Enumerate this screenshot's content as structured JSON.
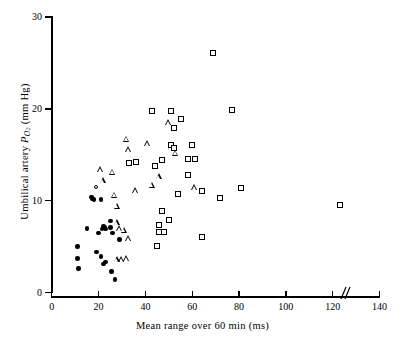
{
  "chart_data": {
    "type": "scatter",
    "title": "",
    "xlabel": "Mean range over 60 min (ms)",
    "ylabel": "Umbilical artery PO2 (mm Hg)",
    "ylabel_parts": {
      "prefix": "Umbilical artery ",
      "symbol": "P",
      "subscript": "O2",
      "suffix": " (mm Hg)"
    },
    "xlim": [
      0,
      140
    ],
    "ylim": [
      0,
      30
    ],
    "xticks": [
      0,
      20,
      40,
      60,
      80,
      100,
      120,
      140
    ],
    "yticks": [
      0,
      10,
      20,
      30
    ],
    "grid": false,
    "legend_position": "none",
    "axis_break": {
      "axis": "x",
      "label": "//",
      "between": [
        100,
        120
      ],
      "position": 106
    },
    "series": [
      {
        "name": "filled-circle",
        "marker": "filled-circle",
        "color": "#000000",
        "points": [
          [
            11,
            5.0
          ],
          [
            11,
            3.7
          ],
          [
            11.5,
            2.6
          ],
          [
            15,
            7.0
          ],
          [
            17,
            10.4
          ],
          [
            17.5,
            10.2
          ],
          [
            18,
            10.1
          ],
          [
            19,
            4.4
          ],
          [
            20,
            6.5
          ],
          [
            21,
            10.1
          ],
          [
            21,
            3.9
          ],
          [
            21.5,
            6.9
          ],
          [
            22,
            7.2
          ],
          [
            22.5,
            7.1
          ],
          [
            23,
            6.9
          ],
          [
            22,
            3.1
          ],
          [
            23,
            3.3
          ],
          [
            25,
            7.8
          ],
          [
            25,
            7.1
          ],
          [
            25.5,
            2.3
          ],
          [
            26,
            6.5
          ],
          [
            27,
            1.4
          ],
          [
            29,
            5.8
          ]
        ]
      },
      {
        "name": "open-circle",
        "marker": "open-circle",
        "color": "#000000",
        "points": [
          [
            19,
            11.5
          ]
        ]
      },
      {
        "name": "open-triangle",
        "marker": "open-triangle",
        "color": "#000000",
        "points": [
          [
            21,
            13.4
          ],
          [
            22,
            12.2
          ],
          [
            26,
            13.1
          ],
          [
            27,
            10.6
          ],
          [
            28,
            9.4
          ],
          [
            28,
            7.6
          ],
          [
            29,
            7.0
          ],
          [
            31,
            6.8
          ],
          [
            32,
            3.7
          ],
          [
            30,
            3.6
          ],
          [
            28,
            3.6
          ],
          [
            32,
            16.7
          ],
          [
            33,
            15.6
          ],
          [
            33,
            5.9
          ],
          [
            36,
            11.1
          ],
          [
            41,
            16.2
          ],
          [
            43,
            11.7
          ],
          [
            46,
            12.6
          ],
          [
            50,
            18.5
          ],
          [
            51,
            15.8
          ],
          [
            53,
            15.2
          ],
          [
            61,
            11.4
          ]
        ]
      },
      {
        "name": "open-square",
        "marker": "open-square",
        "color": "#000000",
        "points": [
          [
            33,
            14.1
          ],
          [
            36,
            14.2
          ],
          [
            43,
            19.8
          ],
          [
            44,
            13.8
          ],
          [
            45,
            5.1
          ],
          [
            46,
            7.3
          ],
          [
            46,
            6.6
          ],
          [
            47,
            8.9
          ],
          [
            47,
            14.4
          ],
          [
            48,
            6.6
          ],
          [
            50,
            7.9
          ],
          [
            51,
            16.1
          ],
          [
            51,
            19.8
          ],
          [
            52,
            15.7
          ],
          [
            52,
            17.9
          ],
          [
            54,
            10.7
          ],
          [
            55,
            18.9
          ],
          [
            58,
            12.8
          ],
          [
            58,
            14.5
          ],
          [
            60,
            16.1
          ],
          [
            61,
            14.5
          ],
          [
            64,
            11.0
          ],
          [
            64,
            6.0
          ],
          [
            69,
            26.1
          ],
          [
            72,
            10.3
          ],
          [
            77,
            19.9
          ],
          [
            81,
            11.4
          ],
          [
            123,
            9.5
          ]
        ]
      }
    ]
  }
}
